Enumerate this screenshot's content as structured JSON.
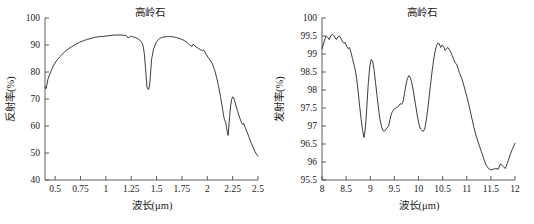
{
  "figure": {
    "panel_count": 2
  },
  "chart_data": [
    {
      "type": "line",
      "id": "reflectance-spectrum",
      "title": "高岭石",
      "xlabel": "波长(μm)",
      "ylabel": "反射率(%)",
      "xlim": [
        0.4,
        2.5
      ],
      "ylim": [
        40,
        100
      ],
      "xticks": [
        0.5,
        0.75,
        1,
        1.25,
        1.5,
        1.75,
        2,
        2.25,
        2.5
      ],
      "xtick_labels": [
        "0.5",
        "0.75",
        "1",
        "1.25",
        "1.5",
        "1.75",
        "2",
        "2.25",
        "2.5"
      ],
      "yticks": [
        40,
        50,
        60,
        70,
        80,
        90,
        100
      ],
      "ytick_labels": [
        "40",
        "50",
        "60",
        "70",
        "80",
        "90",
        "100"
      ],
      "grid": false,
      "legend": false,
      "series": [
        {
          "name": "高岭石反射率",
          "color": "#1a1a1a",
          "x": [
            0.4,
            0.41,
            0.42,
            0.43,
            0.45,
            0.47,
            0.49,
            0.52,
            0.55,
            0.58,
            0.62,
            0.66,
            0.7,
            0.74,
            0.78,
            0.82,
            0.86,
            0.9,
            0.94,
            0.98,
            1.02,
            1.06,
            1.1,
            1.14,
            1.18,
            1.2,
            1.22,
            1.24,
            1.25,
            1.26,
            1.28,
            1.3,
            1.32,
            1.34,
            1.36,
            1.37,
            1.38,
            1.39,
            1.4,
            1.405,
            1.41,
            1.42,
            1.43,
            1.44,
            1.45,
            1.47,
            1.5,
            1.53,
            1.56,
            1.6,
            1.64,
            1.68,
            1.72,
            1.76,
            1.8,
            1.83,
            1.85,
            1.86,
            1.87,
            1.89,
            1.91,
            1.93,
            1.95,
            1.96,
            1.97,
            1.99,
            2.01,
            2.03,
            2.05,
            2.07,
            2.09,
            2.11,
            2.13,
            2.15,
            2.16,
            2.17,
            2.18,
            2.19,
            2.2,
            2.205,
            2.21,
            2.22,
            2.23,
            2.24,
            2.25,
            2.26,
            2.27,
            2.28,
            2.3,
            2.32,
            2.34,
            2.35,
            2.36,
            2.37,
            2.39,
            2.41,
            2.43,
            2.45,
            2.47,
            2.49,
            2.5
          ],
          "y": [
            74.5,
            73.8,
            75.5,
            77.5,
            79.5,
            81.3,
            82.8,
            84.5,
            85.8,
            87.0,
            88.3,
            89.3,
            90.2,
            91.0,
            91.6,
            92.1,
            92.5,
            92.9,
            93.1,
            93.2,
            93.4,
            93.6,
            93.7,
            93.7,
            93.6,
            93.5,
            92.6,
            93.1,
            93.2,
            93.1,
            92.9,
            92.6,
            92.2,
            91.6,
            90.5,
            89.2,
            86.5,
            82.0,
            77.0,
            74.5,
            74.0,
            73.5,
            74.8,
            79.0,
            84.5,
            88.5,
            91.3,
            92.4,
            92.9,
            93.1,
            93.1,
            92.9,
            92.5,
            91.9,
            91.0,
            89.8,
            89.5,
            90.3,
            90.0,
            89.3,
            88.8,
            88.3,
            87.9,
            88.2,
            87.9,
            86.5,
            85.3,
            84.3,
            83.0,
            81.0,
            78.3,
            75.0,
            71.0,
            66.5,
            64.0,
            62.3,
            61.5,
            59.5,
            57.0,
            56.5,
            58.5,
            63.5,
            67.5,
            69.8,
            70.8,
            70.5,
            69.3,
            67.8,
            65.3,
            63.0,
            61.0,
            60.5,
            61.0,
            59.8,
            58.0,
            56.0,
            54.0,
            52.2,
            50.5,
            49.3,
            48.8
          ]
        }
      ]
    },
    {
      "type": "line",
      "id": "emissivity-spectrum",
      "title": "高岭石",
      "xlabel": "波长(μm)",
      "ylabel": "发射率(%)",
      "xlim": [
        8,
        12
      ],
      "ylim": [
        95.5,
        100
      ],
      "xticks": [
        8,
        8.5,
        9,
        9.5,
        10,
        10.5,
        11,
        11.5,
        12
      ],
      "xtick_labels": [
        "8",
        "8.5",
        "9",
        "9.5",
        "10",
        "10.5",
        "11",
        "11.5",
        "12"
      ],
      "yticks": [
        95.5,
        96,
        96.5,
        97,
        97.5,
        98,
        98.5,
        99,
        99.5,
        100
      ],
      "ytick_labels": [
        "95.5",
        "96",
        "96.5",
        "97",
        "97.5",
        "98",
        "98.5",
        "99",
        "99.5",
        "100"
      ],
      "grid": false,
      "legend": false,
      "series": [
        {
          "name": "高岭石发射率",
          "color": "#1a1a1a",
          "x": [
            8.0,
            8.03,
            8.06,
            8.09,
            8.12,
            8.15,
            8.18,
            8.21,
            8.24,
            8.27,
            8.3,
            8.33,
            8.36,
            8.39,
            8.42,
            8.45,
            8.48,
            8.51,
            8.54,
            8.57,
            8.6,
            8.63,
            8.66,
            8.69,
            8.72,
            8.75,
            8.78,
            8.81,
            8.84,
            8.87,
            8.9,
            8.93,
            8.96,
            8.99,
            9.02,
            9.05,
            9.08,
            9.11,
            9.14,
            9.17,
            9.2,
            9.23,
            9.26,
            9.29,
            9.32,
            9.35,
            9.38,
            9.41,
            9.44,
            9.47,
            9.5,
            9.53,
            9.56,
            9.59,
            9.62,
            9.65,
            9.68,
            9.71,
            9.74,
            9.77,
            9.8,
            9.83,
            9.86,
            9.89,
            9.92,
            9.95,
            9.98,
            10.01,
            10.04,
            10.07,
            10.1,
            10.13,
            10.16,
            10.19,
            10.22,
            10.25,
            10.28,
            10.31,
            10.34,
            10.37,
            10.4,
            10.43,
            10.46,
            10.49,
            10.52,
            10.55,
            10.58,
            10.61,
            10.64,
            10.67,
            10.7,
            10.73,
            10.76,
            10.79,
            10.82,
            10.85,
            10.9,
            10.95,
            11.0,
            11.05,
            11.1,
            11.15,
            11.2,
            11.25,
            11.3,
            11.35,
            11.4,
            11.45,
            11.5,
            11.55,
            11.6,
            11.65,
            11.7,
            11.75,
            11.8,
            11.85,
            11.9,
            11.95,
            12.0
          ],
          "y": [
            99.15,
            99.28,
            99.42,
            99.5,
            99.46,
            99.4,
            99.5,
            99.55,
            99.52,
            99.45,
            99.4,
            99.48,
            99.5,
            99.44,
            99.35,
            99.3,
            99.32,
            99.22,
            99.15,
            99.18,
            99.05,
            98.88,
            98.72,
            98.55,
            98.3,
            97.95,
            97.55,
            97.2,
            96.9,
            96.68,
            96.95,
            97.55,
            98.2,
            98.65,
            98.85,
            98.8,
            98.55,
            98.2,
            97.85,
            97.5,
            97.2,
            97.0,
            96.88,
            96.85,
            96.9,
            96.95,
            97.0,
            97.18,
            97.35,
            97.42,
            97.48,
            97.5,
            97.52,
            97.55,
            97.62,
            97.6,
            97.68,
            97.9,
            98.15,
            98.32,
            98.4,
            98.35,
            98.2,
            98.0,
            97.75,
            97.5,
            97.25,
            97.05,
            96.92,
            96.88,
            96.85,
            96.92,
            97.15,
            97.45,
            97.8,
            98.15,
            98.5,
            98.8,
            99.05,
            99.22,
            99.3,
            99.28,
            99.18,
            99.25,
            99.22,
            99.1,
            99.15,
            99.18,
            99.12,
            99.05,
            98.95,
            98.85,
            98.75,
            98.72,
            98.6,
            98.48,
            98.3,
            98.08,
            97.82,
            97.55,
            97.25,
            96.95,
            96.7,
            96.5,
            96.3,
            96.1,
            95.92,
            95.82,
            95.78,
            95.8,
            95.82,
            95.8,
            95.95,
            95.88,
            95.82,
            96.0,
            96.2,
            96.38,
            96.52
          ]
        }
      ]
    }
  ]
}
